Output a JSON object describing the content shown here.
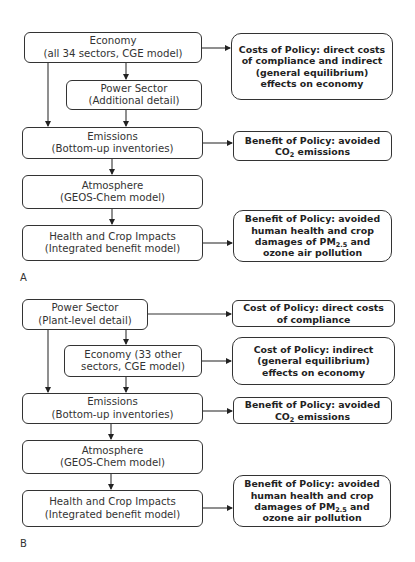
{
  "panels": {
    "A": {
      "label": "A",
      "economy": {
        "line1": "Economy",
        "line2": "(all 34 sectors, CGE model)"
      },
      "power": {
        "line1": "Power Sector",
        "line2": "(Additional detail)"
      },
      "emissions": {
        "line1": "Emissions",
        "line2": "(Bottom-up inventories)"
      },
      "atmosphere": {
        "line1": "Atmosphere",
        "line2": "(GEOS-Chem model)"
      },
      "health": {
        "line1": "Health and Crop Impacts",
        "line2": "(Integrated benefit model)"
      },
      "costs": {
        "line1": "Costs of Policy: direct costs",
        "line2": "of compliance and indirect",
        "line3": "(general equilibrium)",
        "line4": "effects on economy"
      },
      "benefit_co2": {
        "line1": "Benefit of Policy: avoided",
        "line2_pre": "CO",
        "line2_sub": "2",
        "line2_post": " emissions"
      },
      "benefit_health": {
        "line1": "Benefit of Policy: avoided",
        "line2": "human health and crop",
        "line3_pre": "damages of PM",
        "line3_sub": "2.5",
        "line3_post": " and",
        "line4": "ozone air pollution"
      }
    },
    "B": {
      "label": "B",
      "power": {
        "line1": "Power Sector",
        "line2": "(Plant-level detail)"
      },
      "economy": {
        "line1": "Economy (33 other",
        "line2": "sectors, CGE model)"
      },
      "emissions": {
        "line1": "Emissions",
        "line2": "(Bottom-up inventories)"
      },
      "atmosphere": {
        "line1": "Atmosphere",
        "line2": "(GEOS-Chem model)"
      },
      "health": {
        "line1": "Health and Crop Impacts",
        "line2": "(Integrated benefit model)"
      },
      "cost_direct": {
        "line1": "Cost of Policy: direct costs",
        "line2": "of compliance"
      },
      "cost_indirect": {
        "line1": "Cost of Policy: indirect",
        "line2": "(general equilibrium)",
        "line3": "effects on economy"
      },
      "benefit_co2": {
        "line1": "Benefit of Policy: avoided",
        "line2_pre": "CO",
        "line2_sub": "2",
        "line2_post": " emissions"
      },
      "benefit_health": {
        "line1": "Benefit of Policy: avoided",
        "line2": "human health and crop",
        "line3_pre": "damages of PM",
        "line3_sub": "2.5",
        "line3_post": " and",
        "line4": "ozone air pollution"
      }
    }
  },
  "colors": {
    "stroke": "#333333",
    "text": "#2a2a2a",
    "background": "#ffffff"
  }
}
